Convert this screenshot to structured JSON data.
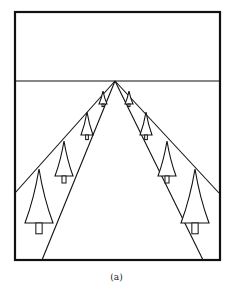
{
  "figure": {
    "caption": "(a)",
    "stroke_color": "#111111",
    "background": "#ffffff",
    "frame": {
      "x1": 15,
      "y1": 12,
      "x2": 220,
      "y2": 260
    },
    "horizon_y": 81,
    "vanishing_point": {
      "x": 115,
      "y": 81
    },
    "lines": [
      {
        "name": "horizon",
        "x1": 15,
        "y1": 81,
        "x2": 220,
        "y2": 81
      },
      {
        "name": "left-tree-line",
        "x1": 115,
        "y1": 81,
        "x2": 15,
        "y2": 193
      },
      {
        "name": "right-tree-line",
        "x1": 115,
        "y1": 81,
        "x2": 219,
        "y2": 193
      },
      {
        "name": "left-road-edge",
        "x1": 115,
        "y1": 81,
        "x2": 42,
        "y2": 260
      },
      {
        "name": "right-road-edge",
        "x1": 115,
        "y1": 81,
        "x2": 203,
        "y2": 260
      }
    ],
    "trees": [
      {
        "side": "left",
        "apex_x": 103,
        "apex_y": 91,
        "half_width": 4,
        "height": 13
      },
      {
        "side": "left",
        "apex_x": 87,
        "apex_y": 112,
        "half_width": 6,
        "height": 23
      },
      {
        "side": "left",
        "apex_x": 64,
        "apex_y": 141,
        "half_width": 9,
        "height": 35
      },
      {
        "side": "left",
        "apex_x": 39,
        "apex_y": 169,
        "half_width": 14,
        "height": 54
      },
      {
        "side": "right",
        "apex_x": 129,
        "apex_y": 91,
        "half_width": 4,
        "height": 13
      },
      {
        "side": "right",
        "apex_x": 146,
        "apex_y": 112,
        "half_width": 6,
        "height": 23
      },
      {
        "side": "right",
        "apex_x": 167,
        "apex_y": 141,
        "half_width": 9,
        "height": 35
      },
      {
        "side": "right",
        "apex_x": 195,
        "apex_y": 169,
        "half_width": 14,
        "height": 54
      }
    ]
  }
}
